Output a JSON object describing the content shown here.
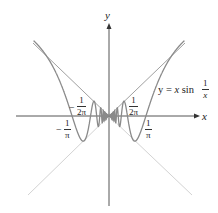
{
  "figure": {
    "axes": {
      "x_label": "x",
      "y_label": "y"
    },
    "curve_label": {
      "prefix": "y = ",
      "var": "x",
      "fn": " sin ",
      "frac_num": "1",
      "frac_den": "x"
    },
    "tick_labels": [
      {
        "id": "neg_one_over_pi",
        "sign": "−",
        "num": "1",
        "den": "π"
      },
      {
        "id": "neg_one_over_2pi",
        "sign": "−",
        "num": "1",
        "den": "2π"
      },
      {
        "id": "one_over_2pi",
        "sign": "",
        "num": "1",
        "den": "2π"
      },
      {
        "id": "one_over_pi",
        "sign": "",
        "num": "1",
        "den": "π"
      }
    ],
    "colors": {
      "curve": "#8a8a8a",
      "envelope_upper": "#9a9a9a",
      "envelope_lower": "#d0d0d0",
      "axis": "#555555"
    }
  },
  "chart_data": {
    "type": "line",
    "title": "",
    "xlabel": "x",
    "ylabel": "y",
    "series": [
      {
        "name": "y = x sin(1/x)",
        "function": "x*sin(1/x)",
        "x_range": [
          -0.65,
          0.65
        ]
      },
      {
        "name": "y = |x|",
        "function": "abs(x)"
      },
      {
        "name": "y = -|x|",
        "function": "-abs(x)"
      }
    ],
    "x_tick_labels": [
      "-1/π",
      "-1/(2π)",
      "1/(2π)",
      "1/π"
    ]
  }
}
